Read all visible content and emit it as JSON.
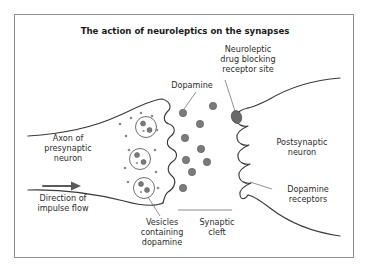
{
  "figure": {
    "title": "The action of neuroleptics on the synapses",
    "border_color": "#8d8d8d",
    "background_color": "#ffffff",
    "ink_color": "#3a3a3a",
    "molecule_fill": "#7b7b7b",
    "leader_color": "#6e6e6e"
  },
  "labels": {
    "neuroleptic": {
      "line1": "Neuroleptic",
      "line2": "drug blocking",
      "line3": "receptor site"
    },
    "dopamine": {
      "line1": "Dopamine"
    },
    "axon": {
      "line1": "Axon of",
      "line2": "presynaptic",
      "line3": "neuron"
    },
    "impulse": {
      "line1": "Direction of",
      "line2": "impulse flow"
    },
    "vesicles": {
      "line1": "Vesicles",
      "line2": "containing",
      "line3": "dopamine"
    },
    "cleft": {
      "line1": "Synaptic",
      "line2": "cleft"
    },
    "postsynaptic": {
      "line1": "Postsynaptic",
      "line2": "neuron"
    },
    "receptors": {
      "line1": "Dopamine",
      "line2": "receptors"
    }
  },
  "diagram": {
    "structures": [
      {
        "name": "presynaptic-neuron-membrane",
        "kind": "axon-terminal"
      },
      {
        "name": "postsynaptic-neuron-membrane",
        "kind": "receptor-membrane"
      },
      {
        "name": "synaptic-cleft",
        "kind": "gap"
      }
    ],
    "receptor_pocket_count": 5,
    "vesicle_count": 3,
    "cleft_molecule_count": 9,
    "blocked_receptor_index": 1
  }
}
